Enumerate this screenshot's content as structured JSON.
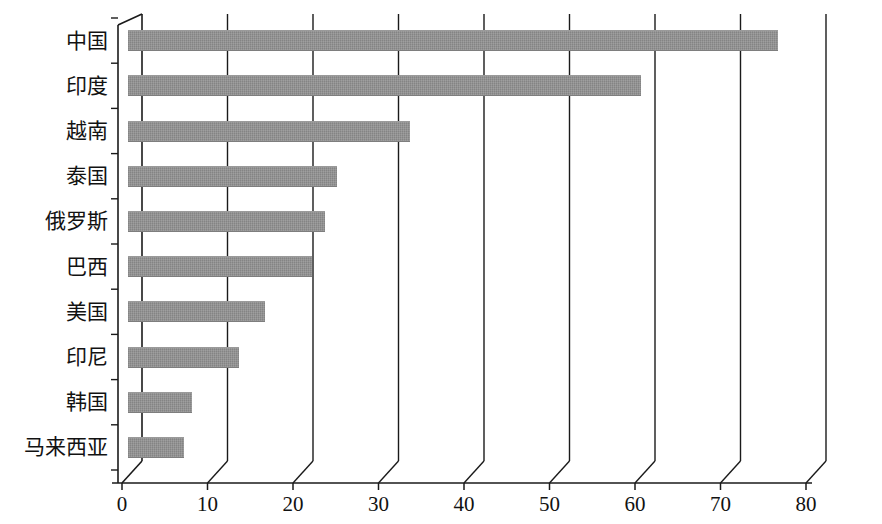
{
  "chart_data": {
    "type": "bar",
    "orientation": "horizontal",
    "title": "",
    "subtitle": "",
    "xlabel": "",
    "ylabel": "",
    "categories": [
      "中国",
      "印度",
      "越南",
      "泰国",
      "俄罗斯",
      "巴西",
      "美国",
      "印尼",
      "韩国",
      "马来西亚"
    ],
    "values": [
      76.0,
      60.0,
      33.0,
      24.5,
      23.0,
      21.5,
      16.0,
      13.0,
      7.5,
      6.5
    ],
    "xlim": [
      0,
      80
    ],
    "xticks": [
      0,
      10,
      20,
      30,
      40,
      50,
      60,
      70,
      80
    ],
    "xtick_labels": [
      "0",
      "10",
      "20",
      "30",
      "40",
      "50",
      "60",
      "70",
      "80"
    ],
    "grid": true,
    "grid_axis": "x",
    "legend": false,
    "legend_position": "none",
    "series": [
      {
        "name": "",
        "values": [
          76.0,
          60.0,
          33.0,
          24.5,
          23.0,
          21.5,
          16.0,
          13.0,
          7.5,
          6.5
        ]
      }
    ],
    "bar_color": "#8e8e8e",
    "axis_color": "#1a1a1a",
    "background_color": "#ffffff",
    "style": "pseudo-3d-skewed-axis"
  }
}
